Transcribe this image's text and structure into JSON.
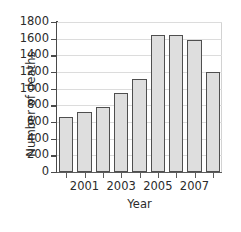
{
  "chart_data": {
    "type": "bar",
    "title": "",
    "xlabel": "Year",
    "ylabel": "Number of deaths",
    "categories": [
      "2000",
      "2001",
      "2002",
      "2003",
      "2004",
      "2005",
      "2006",
      "2007",
      "2008"
    ],
    "values": [
      660,
      720,
      780,
      950,
      1120,
      1650,
      1650,
      1590,
      1200
    ],
    "series": [
      {
        "name": "Number of deaths",
        "values": [
          660,
          720,
          780,
          950,
          1120,
          1650,
          1650,
          1590,
          1200
        ]
      }
    ],
    "ylim": [
      0,
      1800
    ],
    "ytick_labels": [
      "1800",
      "1600",
      "1400",
      "1200",
      "1000",
      "800",
      "600",
      "400",
      "200",
      "0"
    ],
    "ytick_values": [
      1800,
      1600,
      1400,
      1200,
      1000,
      800,
      600,
      400,
      200,
      0
    ],
    "xtick_labels": [
      "2001",
      "2003",
      "2005",
      "2007"
    ],
    "xtick_values": [
      "2001",
      "2003",
      "2005",
      "2007"
    ],
    "grid": true,
    "grid_axis": "y",
    "legend": false,
    "legend_position": "none",
    "bar_fill_color": "#dedede",
    "bar_edge_color": "#4f4f4f",
    "gridline_color": "#dcdcdc",
    "axis_color": "#4a4a4a",
    "background_color": "#ffffff"
  }
}
